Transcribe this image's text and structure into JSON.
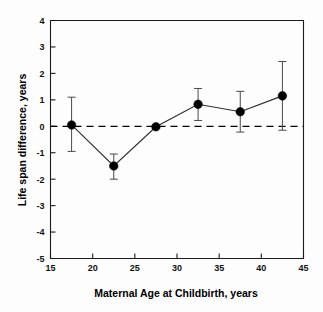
{
  "chart_data": {
    "type": "scatter",
    "title": "",
    "xlabel": "Maternal Age at Childbirth, years",
    "ylabel": "Life span difference, years",
    "xlim": [
      15,
      45
    ],
    "ylim": [
      -5,
      4
    ],
    "xticks": [
      15,
      20,
      25,
      30,
      35,
      40,
      45
    ],
    "xtick_labels": [
      "15",
      "20",
      "25",
      "30",
      "35",
      "40",
      "45"
    ],
    "yticks": [
      -5,
      -4,
      -3,
      -2,
      -1,
      0,
      1,
      2,
      3,
      4
    ],
    "ytick_labels": [
      "-5",
      "-4",
      "-3",
      "-2",
      "-1",
      "0",
      "1",
      "2",
      "3",
      "4"
    ],
    "grid": false,
    "legend": "none",
    "reference_line": {
      "y": 0,
      "style": "dashed",
      "label": "zero difference"
    },
    "x": [
      17.5,
      22.5,
      27.5,
      32.5,
      37.5,
      42.5
    ],
    "values": [
      0.05,
      -1.5,
      -0.02,
      0.83,
      0.55,
      1.15
    ],
    "err_low": [
      -0.95,
      -2.0,
      -0.02,
      0.22,
      -0.22,
      -0.15
    ],
    "err_high": [
      1.1,
      -1.05,
      -0.02,
      1.43,
      1.32,
      2.45
    ],
    "marker": "filled-circle",
    "series": [
      {
        "name": "Life span difference",
        "x": [
          17.5,
          22.5,
          27.5,
          32.5,
          37.5,
          42.5
        ],
        "values": [
          0.05,
          -1.5,
          -0.02,
          0.83,
          0.55,
          1.15
        ]
      }
    ]
  },
  "figure": {
    "background_color": "#fdfdfd",
    "axis_color": "#1a1a1a",
    "marker_color": "#000000",
    "error_color": "#4a4a4a"
  }
}
